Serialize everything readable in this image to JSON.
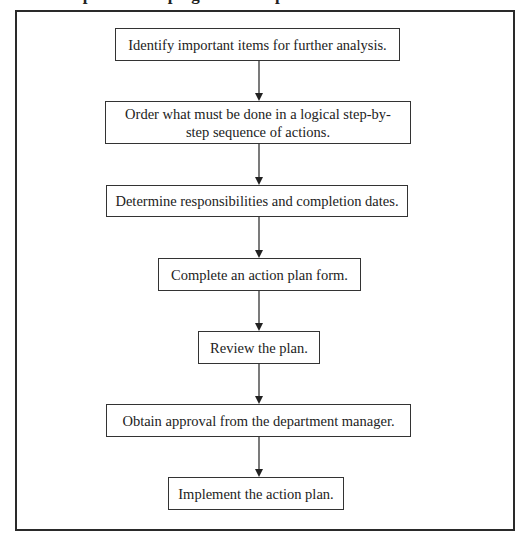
{
  "diagram": {
    "title_cut": "Steps in developing an action plan",
    "steps": [
      {
        "id": "s1",
        "label": "Identify important items for further analysis."
      },
      {
        "id": "s2",
        "label": "Order what must be done in a logical step-by-step sequence of actions."
      },
      {
        "id": "s3",
        "label": "Determine responsibilities and completion dates."
      },
      {
        "id": "s4",
        "label": "Complete an action plan form."
      },
      {
        "id": "s5",
        "label": "Review the plan."
      },
      {
        "id": "s6",
        "label": "Obtain approval from the department manager."
      },
      {
        "id": "s7",
        "label": "Implement the action plan."
      }
    ],
    "edges": [
      {
        "from": "s1",
        "to": "s2"
      },
      {
        "from": "s2",
        "to": "s3"
      },
      {
        "from": "s3",
        "to": "s4"
      },
      {
        "from": "s4",
        "to": "s5"
      },
      {
        "from": "s5",
        "to": "s6"
      },
      {
        "from": "s6",
        "to": "s7"
      }
    ]
  }
}
